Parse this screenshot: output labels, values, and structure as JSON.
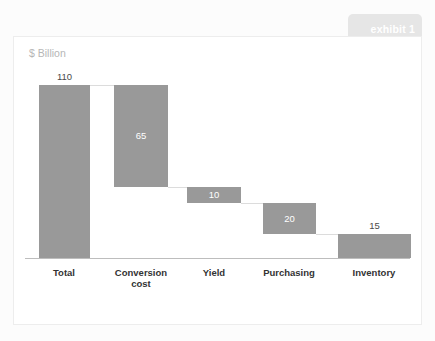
{
  "tab": {
    "label": "exhibit 1"
  },
  "chart": {
    "unit_label": "$ Billion",
    "colors": {
      "bar": "#999999",
      "axis": "#bdbdbd",
      "tab": "#e6e6e6",
      "card": "#ffffff",
      "page_background": "#fcfcfc",
      "value_inside_text": "#ffffff",
      "value_above_text": "#4a4a4a",
      "category_text": "#333333",
      "unit_text": "#b6b6b6"
    }
  },
  "chart_data": {
    "type": "bar",
    "subtype": "waterfall",
    "title": "",
    "subtitle": "",
    "xlabel": "",
    "ylabel": "$ Billion",
    "ylim": [
      0,
      115
    ],
    "grid": false,
    "legend": null,
    "categories": [
      "Total",
      "Conversion cost",
      "Yield",
      "Purchasing",
      "Inventory"
    ],
    "values": [
      110,
      65,
      10,
      20,
      15
    ],
    "bars": [
      {
        "category": "Total",
        "label_lines": [
          "Total"
        ],
        "value": 110,
        "value_text": "110",
        "value_position": "above",
        "base": 0,
        "top": 110,
        "is_total": true
      },
      {
        "category": "Conversion cost",
        "label_lines": [
          "Conversion",
          "cost"
        ],
        "value": 65,
        "value_text": "65",
        "value_position": "inside",
        "base": 45,
        "top": 110,
        "is_total": false
      },
      {
        "category": "Yield",
        "label_lines": [
          "Yield"
        ],
        "value": 10,
        "value_text": "10",
        "value_position": "inside",
        "base": 35,
        "top": 45,
        "is_total": false
      },
      {
        "category": "Purchasing",
        "label_lines": [
          "Purchasing"
        ],
        "value": 20,
        "value_text": "20",
        "value_position": "inside",
        "base": 15,
        "top": 35,
        "is_total": false
      },
      {
        "category": "Inventory",
        "label_lines": [
          "Inventory"
        ],
        "value": 15,
        "value_text": "15",
        "value_position": "above",
        "base": 0,
        "top": 15,
        "is_total": false
      }
    ]
  }
}
